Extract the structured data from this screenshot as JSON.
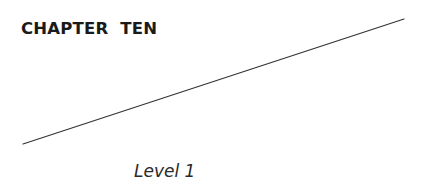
{
  "page": {
    "chapter_title": "CHAPTER  TEN",
    "level_label": "Level 1"
  },
  "decoration": {
    "rule_line": {
      "x1": 23,
      "y1": 144,
      "x2": 404,
      "y2": 19,
      "color": "#333333"
    }
  }
}
